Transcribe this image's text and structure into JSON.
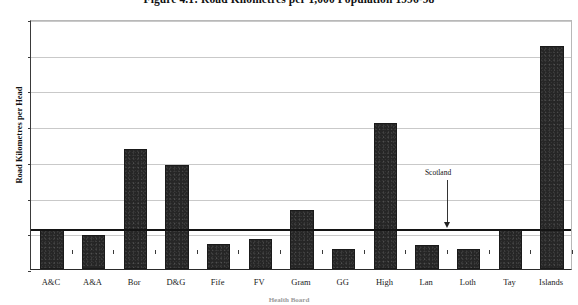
{
  "chart_data": {
    "type": "bar",
    "title": "Figure 4.1: Road Kilometres per 1,000 Population 1996-98",
    "xlabel": "Health Board",
    "ylabel": "Road Kilometres per Head",
    "categories": [
      "A&C",
      "A&A",
      "Bor",
      "D&G",
      "Fife",
      "FV",
      "Gram",
      "GG",
      "High",
      "Lan",
      "Loth",
      "Tay",
      "Islands"
    ],
    "values": [
      11.2,
      9.5,
      33.5,
      29.0,
      7.0,
      8.5,
      16.5,
      5.5,
      41.0,
      6.8,
      5.5,
      11.2,
      62.5
    ],
    "ylim": [
      0,
      70
    ],
    "yticks": [
      0,
      10,
      20,
      30,
      40,
      50,
      60,
      70
    ],
    "ytick_labels": [
      "0",
      "10",
      "20",
      "30",
      "40",
      "50",
      "60",
      "70"
    ],
    "grid": true,
    "legend": "none",
    "bar_color": "#262626",
    "reference_line": {
      "label": "Scotland",
      "value": 11.5,
      "color": "#141414"
    }
  }
}
